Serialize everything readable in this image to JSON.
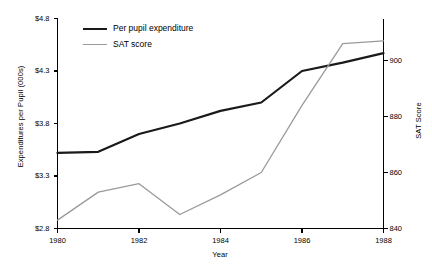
{
  "chart_data": {
    "type": "line",
    "title": "",
    "xlabel": "Year",
    "ylabel": "Expenditures per Pupil (000s)",
    "y2label": "SAT Score",
    "grid": false,
    "legend_position": "top-left-inside",
    "x": [
      1980,
      1981,
      1982,
      1983,
      1984,
      1985,
      1986,
      1987,
      1988
    ],
    "xlim": [
      1980,
      1988
    ],
    "xticks": [
      1980,
      1982,
      1984,
      1986,
      1988
    ],
    "xticklabels": [
      "1980",
      "1982",
      "1984",
      "1986",
      "1988"
    ],
    "ylim": [
      2.8,
      4.8
    ],
    "yticks": [
      2.8,
      3.3,
      3.8,
      4.3,
      4.8
    ],
    "yticklabels": [
      "$2.8",
      "$3.3",
      "$3.8",
      "$4.3",
      "$4.8"
    ],
    "y2lim": [
      840,
      915
    ],
    "y2ticks": [
      840,
      860,
      880,
      900
    ],
    "y2ticklabels": [
      "840",
      "860",
      "880",
      "900"
    ],
    "series": [
      {
        "name": "Per pupil expenditure",
        "axis": "left",
        "color": "#1a1a1a",
        "linewidth": 2.2,
        "values": [
          3.52,
          3.53,
          3.7,
          3.8,
          3.92,
          4.0,
          4.3,
          4.38,
          4.47
        ]
      },
      {
        "name": "SAT score",
        "axis": "right",
        "color": "#9a9a9a",
        "linewidth": 1.3,
        "values": [
          843,
          853,
          856,
          845,
          852,
          860,
          884,
          906,
          907
        ]
      }
    ]
  },
  "legend": {
    "items": [
      {
        "label": "Per pupil expenditure",
        "color": "#1a1a1a",
        "linewidth": 2.2
      },
      {
        "label": "SAT score",
        "color": "#9a9a9a",
        "linewidth": 1.3
      }
    ]
  },
  "axes": {
    "left_title": "Expenditures per Pupil (000s)",
    "right_title": "SAT Score",
    "bottom_title": "Year"
  }
}
